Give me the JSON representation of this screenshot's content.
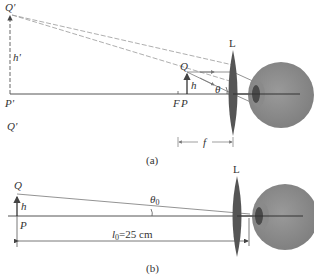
{
  "figure_a": {
    "caption": "(a)",
    "labels": {
      "q_prime_top": "Q'",
      "h_prime": "h'",
      "p_prime": "P'",
      "q_prime_bottom": "Q'",
      "q": "Q",
      "h": "h",
      "f_point": "F",
      "p_point": "P",
      "theta": "θ",
      "lens": "L",
      "focal_length": "f"
    }
  },
  "figure_b": {
    "caption": "(b)",
    "labels": {
      "q": "Q",
      "h": "h",
      "p": "P",
      "theta0": "θ",
      "theta0_sub": "0",
      "lens": "L",
      "distance_l": "l",
      "distance_sub": "0",
      "distance_value": "=25 cm"
    }
  },
  "colors": {
    "line": "#555555",
    "dashed": "#888888",
    "lens": "#555555",
    "eye": "#8a8a8a",
    "pupil": "#4a4a4a"
  }
}
